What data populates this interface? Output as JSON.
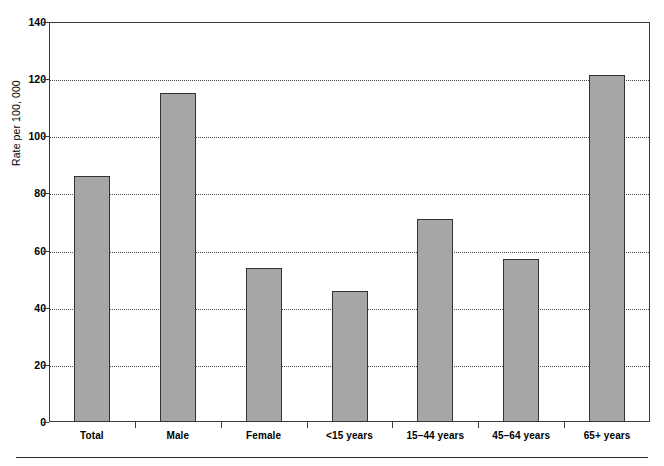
{
  "chart_data": {
    "type": "bar",
    "title": "",
    "subtitle": "",
    "xlabel": "",
    "ylabel": "Rate per 100, 000",
    "categories": [
      "Total",
      "Male",
      "Female",
      "<15 years",
      "15–44 years",
      "45–64 years",
      "65+ years"
    ],
    "values": [
      86,
      115,
      54,
      46,
      71,
      57,
      121.5
    ],
    "ylim": [
      0,
      140
    ],
    "ytick_labels": [
      "0",
      "20",
      "40",
      "60",
      "80",
      "100",
      "120",
      "140"
    ],
    "ytick_values": [
      0,
      20,
      40,
      60,
      80,
      100,
      120,
      140
    ],
    "grid": "horizontal-dotted",
    "legend": "none",
    "bar_color": "#a6a6a6",
    "bar_border_color": "#333333",
    "axis_color": "#3b3b3b",
    "grid_color": "#4a4a4a",
    "background": "#ffffff"
  }
}
